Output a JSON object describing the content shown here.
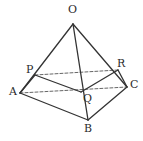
{
  "figure": {
    "canvas": {
      "width": 143,
      "height": 141,
      "background": "#ffffff"
    },
    "stroke": {
      "solid_color": "#333333",
      "dashed_color": "#555555",
      "solid_width": 1.3,
      "dashed_width": 0.9,
      "dash_pattern": "3,2"
    },
    "vertices": [
      {
        "id": "O",
        "label": "O",
        "x": 73,
        "y": 24,
        "label_x": 68,
        "label_y": 4
      },
      {
        "id": "P",
        "label": "P",
        "x": 35,
        "y": 75,
        "label_x": 26,
        "label_y": 64
      },
      {
        "id": "R",
        "label": "R",
        "x": 118,
        "y": 70,
        "label_x": 117,
        "label_y": 58
      },
      {
        "id": "A",
        "label": "A",
        "x": 20,
        "y": 93,
        "label_x": 9,
        "label_y": 86
      },
      {
        "id": "C",
        "label": "C",
        "x": 127,
        "y": 87,
        "label_x": 130,
        "label_y": 79
      },
      {
        "id": "Q",
        "label": "Q",
        "x": 81,
        "y": 92,
        "label_x": 83,
        "label_y": 93
      },
      {
        "id": "B",
        "label": "B",
        "x": 88,
        "y": 120,
        "label_x": 84,
        "label_y": 123
      }
    ],
    "edges_solid": [
      {
        "name": "edge-O-A",
        "from": "O",
        "to": "A"
      },
      {
        "name": "edge-O-B",
        "from": "O",
        "to": "B"
      },
      {
        "name": "edge-O-C",
        "from": "O",
        "to": "C"
      },
      {
        "name": "edge-A-B",
        "from": "A",
        "to": "B"
      },
      {
        "name": "edge-B-C",
        "from": "B",
        "to": "C"
      },
      {
        "name": "edge-P-A",
        "from": "P",
        "to": "A"
      },
      {
        "name": "edge-R-C",
        "from": "R",
        "to": "C"
      },
      {
        "name": "edge-P-Q",
        "from": "P",
        "to": "Q"
      },
      {
        "name": "edge-Q-R",
        "from": "Q",
        "to": "R"
      }
    ],
    "edges_dashed": [
      {
        "name": "edge-P-R",
        "from": "P",
        "to": "R"
      },
      {
        "name": "edge-A-C",
        "from": "A",
        "to": "C"
      }
    ]
  }
}
